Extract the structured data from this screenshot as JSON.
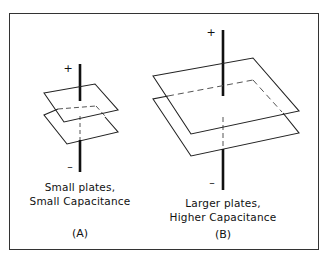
{
  "diagram": {
    "panel_a": {
      "plus_sign": "+",
      "minus_sign": "–",
      "caption_line1": "Small plates,",
      "caption_line2": "Small Capacitance",
      "label": "(A)"
    },
    "panel_b": {
      "plus_sign": "+",
      "minus_sign": "–",
      "caption_line1": "Larger plates,",
      "caption_line2": "Higher Capacitance",
      "label": "(B)"
    },
    "colors": {
      "line": "#222222",
      "background": "#ffffff",
      "dashed": "#555555"
    }
  }
}
